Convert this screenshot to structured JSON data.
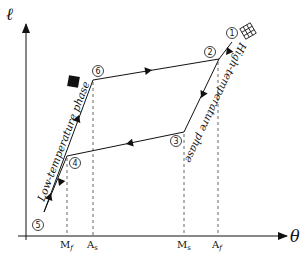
{
  "diagram": {
    "axes": {
      "y_label": "ℓ",
      "x_label": "θ"
    },
    "temperature_marks": [
      {
        "id": "Mf",
        "label_main": "M",
        "label_sub": "f",
        "x": 67
      },
      {
        "id": "As",
        "label_main": "A",
        "label_sub": "s",
        "x": 93
      },
      {
        "id": "Ms",
        "label_main": "M",
        "label_sub": "s",
        "x": 184
      },
      {
        "id": "Af",
        "label_main": "A",
        "label_sub": "f",
        "x": 218
      }
    ],
    "points": [
      {
        "id": "1",
        "label": "1",
        "x": 232,
        "y": 20
      },
      {
        "id": "2",
        "label": "2",
        "x": 219,
        "y": 59
      },
      {
        "id": "3",
        "label": "3",
        "x": 184,
        "y": 132
      },
      {
        "id": "4",
        "label": "4",
        "x": 67,
        "y": 156
      },
      {
        "id": "5",
        "label": "5",
        "x": 44,
        "y": 212
      },
      {
        "id": "6",
        "label": "6",
        "x": 93,
        "y": 80
      }
    ],
    "phase_labels": {
      "low": "Low-temperature phase",
      "high": "High-temperature phase"
    },
    "icons": {
      "low_phase": "solid-square-icon",
      "high_phase": "grid-lattice-icon"
    },
    "colors": {
      "line": "#111111",
      "dashed": "#555555",
      "background": "#ffffff"
    }
  }
}
